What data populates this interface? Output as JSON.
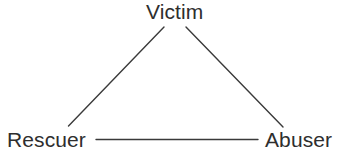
{
  "diagram": {
    "background_color": "#ffffff",
    "line_color": "#3a3a3a",
    "text_color": "#2e2e2e",
    "nodes": [
      {
        "id": "victim",
        "label": "Victim",
        "position": "top"
      },
      {
        "id": "rescuer",
        "label": "Rescuer",
        "position": "bottom-left"
      },
      {
        "id": "abuser",
        "label": "Abuser",
        "position": "bottom-right"
      }
    ],
    "edges": [
      {
        "from": "victim",
        "to": "rescuer",
        "style": "solid"
      },
      {
        "from": "victim",
        "to": "abuser",
        "style": "solid"
      },
      {
        "from": "rescuer",
        "to": "abuser",
        "style": "solid"
      }
    ]
  }
}
